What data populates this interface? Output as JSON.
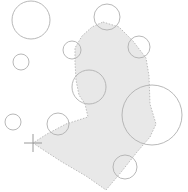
{
  "canvas": {
    "width": 188,
    "height": 192,
    "background_color": "#ffffff",
    "title": ""
  },
  "style": {
    "polygon_fill": "#e8e8e8",
    "polygon_stroke": "#bdbdbd",
    "polygon_stroke_dash": "1.5 1.5",
    "polygon_stroke_width": 1,
    "circle_fill": "none",
    "circle_stroke": "#b0b0b0",
    "circle_stroke_width": 0.9,
    "marker_stroke": "#9a9a9a",
    "marker_stroke_width": 1
  },
  "figure": {
    "polygon": {
      "name": "region-polygon",
      "points": "103,22 119,27 133,41 146,58 149,76 150,104 156,124 150,137 137,152 122,171 106,190 86,176 62,162 42,149 33,143 47,134 66,124 88,117 85,104 79,95 76,80 75,62 75,48 82,36 92,27"
    },
    "circles": [
      {
        "name": "circle-top-left-large",
        "cx": 31,
        "cy": 20,
        "r": 19
      },
      {
        "name": "circle-left-small-upper",
        "cx": 21,
        "cy": 62,
        "r": 8
      },
      {
        "name": "circle-top-center",
        "cx": 107,
        "cy": 17,
        "r": 13
      },
      {
        "name": "circle-upper-left-node",
        "cx": 72,
        "cy": 50,
        "r": 9
      },
      {
        "name": "circle-upper-right-node",
        "cx": 139,
        "cy": 47,
        "r": 11
      },
      {
        "name": "circle-center-mid",
        "cx": 89,
        "cy": 87,
        "r": 17
      },
      {
        "name": "circle-right-large",
        "cx": 152,
        "cy": 115,
        "r": 30
      },
      {
        "name": "circle-left-small-lower",
        "cx": 13,
        "cy": 122,
        "r": 8
      },
      {
        "name": "circle-lower-mid-node",
        "cx": 58,
        "cy": 124,
        "r": 11
      },
      {
        "name": "circle-bottom-node",
        "cx": 125,
        "cy": 167,
        "r": 12
      }
    ],
    "marker": {
      "name": "crosshair-marker",
      "cx": 33,
      "cy": 143,
      "arm": 9
    }
  }
}
